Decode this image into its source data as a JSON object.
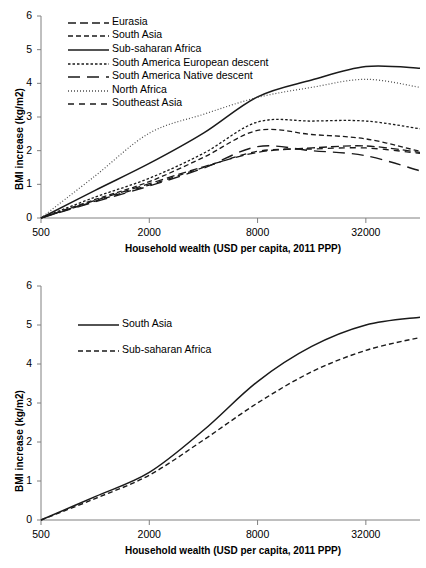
{
  "chart_data": [
    {
      "id": "top",
      "type": "line",
      "title": "",
      "xlabel": "Household wealth (USD per capita, 2011 PPP)",
      "ylabel": "BMI increase (kg/m2)",
      "xscale": "log",
      "xticks": [
        500,
        2000,
        8000,
        32000
      ],
      "xticklabels": [
        "500",
        "2000",
        "8000",
        "32000"
      ],
      "xlim": [
        500,
        64000
      ],
      "yticks": [
        0,
        1,
        2,
        3,
        4,
        5,
        6
      ],
      "yticklabels": [
        "0",
        "1",
        "2",
        "3",
        "4",
        "5",
        "6"
      ],
      "ylim": [
        0,
        6
      ],
      "grid": false,
      "legend_position": "upper-left",
      "x": [
        500,
        1000,
        2000,
        4000,
        8000,
        16000,
        32000,
        64000
      ],
      "series": [
        {
          "name": "Eurasia",
          "dash": "8,4",
          "width": 1.3,
          "color": "#1a1a1a",
          "values": [
            0,
            0.52,
            1.02,
            1.52,
            1.95,
            2.08,
            2.14,
            1.95
          ]
        },
        {
          "name": "South Asia",
          "dash": "5,3",
          "width": 1.3,
          "color": "#1a1a1a",
          "values": [
            0,
            0.55,
            1.08,
            1.8,
            2.6,
            2.48,
            2.35,
            1.98
          ]
        },
        {
          "name": "Sub-saharan Africa",
          "dash": "none",
          "width": 1.5,
          "color": "#1a1a1a",
          "values": [
            0,
            0.82,
            1.62,
            2.52,
            3.6,
            4.1,
            4.5,
            4.45
          ]
        },
        {
          "name": "South America European descent",
          "dash": "2.5,2",
          "width": 1.3,
          "color": "#1a1a1a",
          "values": [
            0,
            0.62,
            1.18,
            1.92,
            2.85,
            2.88,
            2.88,
            2.65
          ]
        },
        {
          "name": "South America Native descent",
          "dash": "12,7",
          "width": 1.4,
          "color": "#1a1a1a",
          "values": [
            0,
            0.48,
            0.95,
            1.48,
            2.12,
            2.0,
            1.85,
            1.4
          ]
        },
        {
          "name": "North Africa",
          "dash": "1,2",
          "width": 1.2,
          "color": "#4d4d4d",
          "values": [
            0,
            1.25,
            2.52,
            3.08,
            3.58,
            3.88,
            4.12,
            3.88
          ]
        },
        {
          "name": "Southeast Asia",
          "dash": "6,5",
          "width": 1.3,
          "color": "#1a1a1a",
          "values": [
            0,
            0.5,
            0.98,
            1.5,
            1.98,
            2.05,
            2.08,
            1.92
          ]
        }
      ]
    },
    {
      "id": "bottom",
      "type": "line",
      "title": "",
      "xlabel": "Household wealth (USD per capita, 2011 PPP)",
      "ylabel": "BMI increase (kg/m2)",
      "xscale": "log",
      "xticks": [
        500,
        2000,
        8000,
        32000
      ],
      "xticklabels": [
        "500",
        "2000",
        "8000",
        "32000"
      ],
      "xlim": [
        500,
        64000
      ],
      "yticks": [
        0,
        1,
        2,
        3,
        4,
        5,
        6
      ],
      "yticklabels": [
        "0",
        "1",
        "2",
        "3",
        "4",
        "5",
        "6"
      ],
      "ylim": [
        0,
        6
      ],
      "grid": false,
      "legend_position": "upper-left",
      "x": [
        500,
        1000,
        2000,
        4000,
        8000,
        16000,
        32000,
        64000
      ],
      "series": [
        {
          "name": "South Asia",
          "dash": "none",
          "width": 1.5,
          "color": "#1a1a1a",
          "values": [
            0,
            0.6,
            1.22,
            2.3,
            3.55,
            4.45,
            5.0,
            5.2
          ]
        },
        {
          "name": "Sub-saharan Africa",
          "dash": "5,3",
          "width": 1.4,
          "color": "#1a1a1a",
          "values": [
            0,
            0.55,
            1.15,
            2.05,
            3.0,
            3.8,
            4.35,
            4.68
          ]
        }
      ]
    }
  ]
}
